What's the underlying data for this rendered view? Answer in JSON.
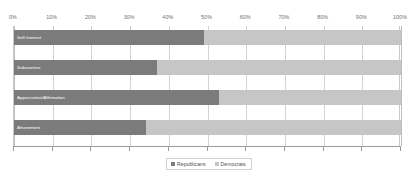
{
  "chart_data": {
    "type": "bar",
    "orientation": "horizontal",
    "stacked": true,
    "stacked_normalized": true,
    "title": "",
    "subtitle": "",
    "xlabel": "",
    "ylabel": "",
    "categories": [
      "Self-Interest",
      "Substantive",
      "Appreciation/Affirmation",
      "Attunement"
    ],
    "series": [
      {
        "name": "Republicans",
        "color": "#7b7b7b",
        "values": [
          49,
          37,
          53,
          34
        ]
      },
      {
        "name": "Democrats",
        "color": "#c6c6c6",
        "values": [
          51,
          63,
          47,
          66
        ]
      }
    ],
    "xlim": [
      0,
      100
    ],
    "xticks": [
      0,
      10,
      20,
      30,
      40,
      50,
      60,
      70,
      80,
      90,
      100
    ],
    "xtick_labels": [
      "0%",
      "10%",
      "20%",
      "30%",
      "40%",
      "50%",
      "60%",
      "70%",
      "80%",
      "90%",
      "100%"
    ],
    "grid": "vertical",
    "legend_position": "bottom",
    "legend_entries": [
      "Republicans",
      "Democrats"
    ],
    "annotations": []
  },
  "axis": {
    "ticks": [
      {
        "value": 0,
        "label": "0%"
      },
      {
        "value": 10,
        "label": "10%"
      },
      {
        "value": 20,
        "label": "20%"
      },
      {
        "value": 30,
        "label": "30%"
      },
      {
        "value": 40,
        "label": "40%"
      },
      {
        "value": 50,
        "label": "50%"
      },
      {
        "value": 60,
        "label": "60%"
      },
      {
        "value": 70,
        "label": "70%"
      },
      {
        "value": 80,
        "label": "80%"
      },
      {
        "value": 90,
        "label": "90%"
      },
      {
        "value": 100,
        "label": "100%"
      }
    ]
  },
  "rows": [
    {
      "label": "Self-Interest",
      "republicans": 49,
      "democrats": 51
    },
    {
      "label": "Substantive",
      "republicans": 37,
      "democrats": 63
    },
    {
      "label": "Appreciation/Affirmation",
      "republicans": 53,
      "democrats": 47
    },
    {
      "label": "Attunement",
      "republicans": 34,
      "democrats": 66
    }
  ],
  "legend": {
    "items": [
      {
        "label": "Republicans",
        "color": "#7b7b7b"
      },
      {
        "label": "Democrats",
        "color": "#c6c6c6"
      }
    ]
  },
  "colors": {
    "republicans": "#7b7b7b",
    "democrats": "#c6c6c6",
    "grid": "#d2d2d2",
    "axis": "#9a9a9a",
    "tick_text": "#6d6d6d",
    "bar_label_text": "#ffffff",
    "background": "#ffffff"
  }
}
